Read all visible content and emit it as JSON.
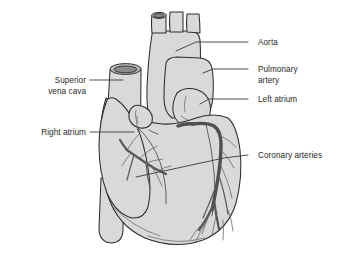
{
  "diagram": {
    "view": "anterior",
    "style": "line-drawing-grayscale",
    "colors": {
      "organ_fill": "#d9d9d9",
      "outline": "#2e2e2e",
      "coronary_vessel": "#4f4f4f",
      "label_text": "#2a2a2a",
      "leader_line": "#3a3a3a",
      "background": "#ffffff"
    },
    "labels": [
      {
        "id": "aorta",
        "text": "Aorta",
        "lines": [
          "Aorta"
        ],
        "side": "right",
        "text_x": 258,
        "text_y": 45,
        "leader": "M 248,42 L 196,42 L 176,51"
      },
      {
        "id": "pulmonary-artery",
        "text": "Pulmonary artery",
        "lines": [
          "Pulmonary",
          "artery"
        ],
        "side": "right",
        "text_x": 258,
        "text_y": 70,
        "leader": "M 248,69 L 213,69 L 203,73"
      },
      {
        "id": "left-atrium",
        "text": "Left atrium",
        "lines": [
          "Left atrium"
        ],
        "side": "right",
        "text_x": 258,
        "text_y": 102,
        "leader": "M 248,99 L 209,99 L 200,104"
      },
      {
        "id": "coronary-arteries",
        "text": "Coronary arteries",
        "lines": [
          "Coronary arteries"
        ],
        "side": "right",
        "text_x": 258,
        "text_y": 158,
        "leader": "M 248,155 L 224,158 L 136,177"
      },
      {
        "id": "superior-vena-cava",
        "text": "Superior vena cava",
        "lines": [
          "Superior",
          "vena cava"
        ],
        "side": "left",
        "text_x": 88,
        "text_y": 84,
        "leader": "M 90,80 L 123,80"
      },
      {
        "id": "right-atrium",
        "text": "Right atrium",
        "lines": [
          "Right atrium"
        ],
        "side": "left",
        "text_x": 88,
        "text_y": 135,
        "leader": "M 90,132 L 134,132"
      }
    ],
    "structures": [
      {
        "id": "aortic-arch",
        "name": "aortic arch"
      },
      {
        "id": "brachiocephalic-branches",
        "name": "aortic branch vessels"
      },
      {
        "id": "pulmonary-trunk",
        "name": "pulmonary trunk"
      },
      {
        "id": "left-atrial-appendage",
        "name": "left atrial appendage"
      },
      {
        "id": "superior-vena-cava-tube",
        "name": "superior vena cava"
      },
      {
        "id": "right-atrium-body",
        "name": "right atrium"
      },
      {
        "id": "right-ventricle",
        "name": "right ventricle"
      },
      {
        "id": "left-ventricle",
        "name": "left ventricle"
      },
      {
        "id": "inferior-vena-cava-tube",
        "name": "inferior vena cava"
      },
      {
        "id": "left-coronary-artery",
        "name": "left coronary artery"
      },
      {
        "id": "right-coronary-artery",
        "name": "right coronary artery"
      },
      {
        "id": "coronary-branches",
        "name": "coronary artery branches"
      }
    ]
  }
}
